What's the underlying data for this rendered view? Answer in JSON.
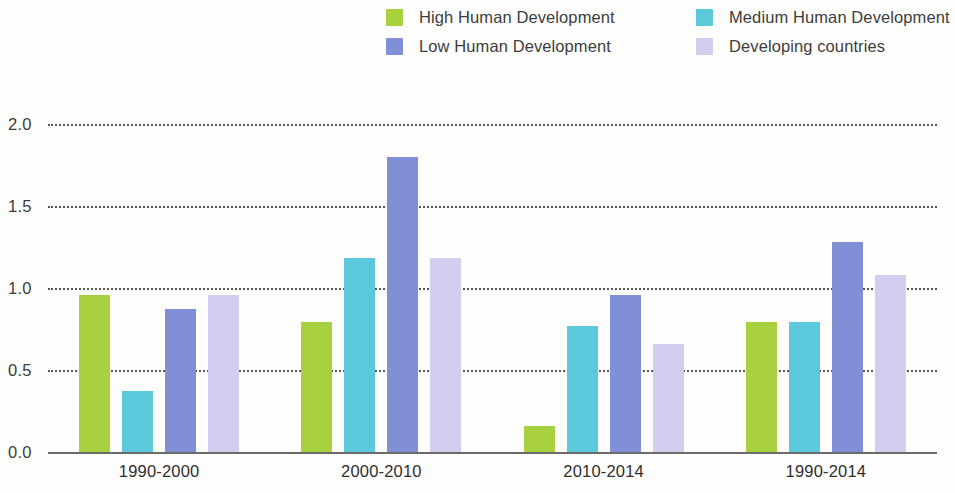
{
  "legend": {
    "items": [
      {
        "label": "High Human Development",
        "color": "#a9d13f",
        "col": 0,
        "row": 0
      },
      {
        "label": "Medium Human Development",
        "color": "#5cc8dc",
        "col": 1,
        "row": 0
      },
      {
        "label": "Low Human Development",
        "color": "#8190d6",
        "col": 0,
        "row": 1
      },
      {
        "label": "Developing countries",
        "color": "#d5cdf0",
        "col": 1,
        "row": 1
      }
    ]
  },
  "axis": {
    "y_ticks": [
      "0.0",
      "0.5",
      "1.0",
      "1.5",
      "2.0"
    ],
    "y_values": [
      0.0,
      0.5,
      1.0,
      1.5,
      2.0
    ]
  },
  "chart_data": {
    "type": "bar",
    "title": "",
    "xlabel": "",
    "ylabel": "",
    "ylim": [
      0.0,
      2.0
    ],
    "grid": true,
    "legend_position": "top",
    "categories": [
      "1990-2000",
      "2000-2010",
      "2010-2014",
      "1990-2014"
    ],
    "series": [
      {
        "name": "High Human Development",
        "color": "#a9d13f",
        "values": [
          0.96,
          0.79,
          0.16,
          0.79
        ]
      },
      {
        "name": "Medium Human Development",
        "color": "#5cc8dc",
        "values": [
          0.37,
          1.18,
          0.77,
          0.79
        ]
      },
      {
        "name": "Low Human Development",
        "color": "#8190d6",
        "values": [
          0.87,
          1.8,
          0.96,
          1.28
        ]
      },
      {
        "name": "Developing countries",
        "color": "#d5cdf0",
        "values": [
          0.96,
          1.18,
          0.66,
          1.08
        ]
      }
    ]
  }
}
